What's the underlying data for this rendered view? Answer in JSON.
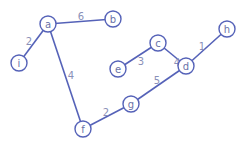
{
  "graph": {
    "nodes": [
      {
        "id": "a",
        "x": 48,
        "y": 24
      },
      {
        "id": "b",
        "x": 113,
        "y": 19
      },
      {
        "id": "i",
        "x": 19,
        "y": 63
      },
      {
        "id": "c",
        "x": 158,
        "y": 43
      },
      {
        "id": "e",
        "x": 118,
        "y": 69
      },
      {
        "id": "h",
        "x": 227,
        "y": 29
      },
      {
        "id": "d",
        "x": 186,
        "y": 66
      },
      {
        "id": "g",
        "x": 131,
        "y": 104
      },
      {
        "id": "f",
        "x": 83,
        "y": 129
      }
    ],
    "edges": [
      {
        "from": "a",
        "to": "b",
        "weight": "6",
        "lx": 81,
        "ly": 16
      },
      {
        "from": "a",
        "to": "i",
        "weight": "2",
        "lx": 29,
        "ly": 41
      },
      {
        "from": "a",
        "to": "f",
        "weight": "4",
        "lx": 71,
        "ly": 75
      },
      {
        "from": "c",
        "to": "e",
        "weight": "3",
        "lx": 141,
        "ly": 61
      },
      {
        "from": "c",
        "to": "d",
        "weight": "4",
        "lx": 177,
        "ly": 62
      },
      {
        "from": "d",
        "to": "h",
        "weight": "1",
        "lx": 202,
        "ly": 46
      },
      {
        "from": "d",
        "to": "g",
        "weight": "5",
        "lx": 157,
        "ly": 80
      },
      {
        "from": "g",
        "to": "f",
        "weight": "2",
        "lx": 106,
        "ly": 112
      }
    ],
    "colors": {
      "stroke": "#5562b8",
      "node_text": "#6a72a8",
      "weight_text": "#8a90b8"
    }
  }
}
